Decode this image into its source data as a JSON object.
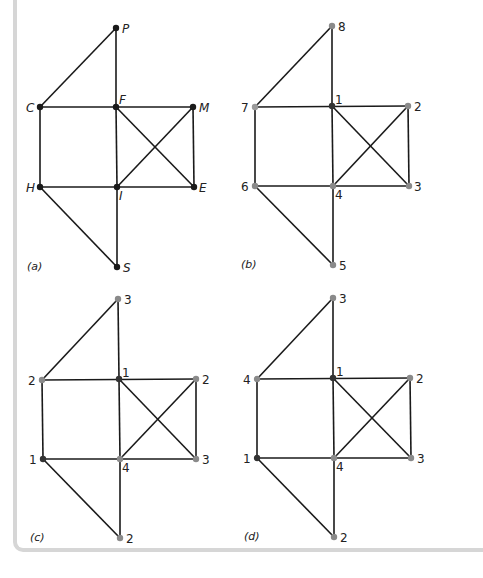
{
  "figure": {
    "colors": {
      "edge": "#1a1a1a",
      "node_dark": "#1a1a1a",
      "node_one": "#333333",
      "node_grey": "#8a8a8a",
      "frame": "#d6d6d6"
    },
    "edges": [
      [
        "P",
        "F"
      ],
      [
        "P",
        "C"
      ],
      [
        "C",
        "F"
      ],
      [
        "F",
        "M"
      ],
      [
        "C",
        "H"
      ],
      [
        "F",
        "I"
      ],
      [
        "M",
        "E"
      ],
      [
        "F",
        "E"
      ],
      [
        "M",
        "I"
      ],
      [
        "H",
        "I"
      ],
      [
        "I",
        "E"
      ],
      [
        "H",
        "S"
      ],
      [
        "I",
        "S"
      ]
    ],
    "panels": [
      {
        "caption": "(a)",
        "nodes": [
          {
            "id": "P",
            "label": "P"
          },
          {
            "id": "C",
            "label": "C"
          },
          {
            "id": "F",
            "label": "F"
          },
          {
            "id": "M",
            "label": "M"
          },
          {
            "id": "H",
            "label": "H"
          },
          {
            "id": "I",
            "label": "I"
          },
          {
            "id": "E",
            "label": "E"
          },
          {
            "id": "S",
            "label": "S"
          }
        ]
      },
      {
        "caption": "(b)",
        "nodes": [
          {
            "id": "P",
            "label": "8"
          },
          {
            "id": "C",
            "label": "7"
          },
          {
            "id": "F",
            "label": "1"
          },
          {
            "id": "M",
            "label": "2"
          },
          {
            "id": "H",
            "label": "6"
          },
          {
            "id": "I",
            "label": "4"
          },
          {
            "id": "E",
            "label": "3"
          },
          {
            "id": "S",
            "label": "5"
          }
        ]
      },
      {
        "caption": "(c)",
        "nodes": [
          {
            "id": "P",
            "label": "3"
          },
          {
            "id": "C",
            "label": "2"
          },
          {
            "id": "F",
            "label": "1"
          },
          {
            "id": "M",
            "label": "2"
          },
          {
            "id": "H",
            "label": "1"
          },
          {
            "id": "I",
            "label": "4"
          },
          {
            "id": "E",
            "label": "3"
          },
          {
            "id": "S",
            "label": "2"
          }
        ]
      },
      {
        "caption": "(d)",
        "nodes": [
          {
            "id": "P",
            "label": "3"
          },
          {
            "id": "C",
            "label": "4"
          },
          {
            "id": "F",
            "label": "1"
          },
          {
            "id": "M",
            "label": "2"
          },
          {
            "id": "H",
            "label": "1"
          },
          {
            "id": "I",
            "label": "4"
          },
          {
            "id": "E",
            "label": "3"
          },
          {
            "id": "S",
            "label": "2"
          }
        ]
      }
    ]
  }
}
